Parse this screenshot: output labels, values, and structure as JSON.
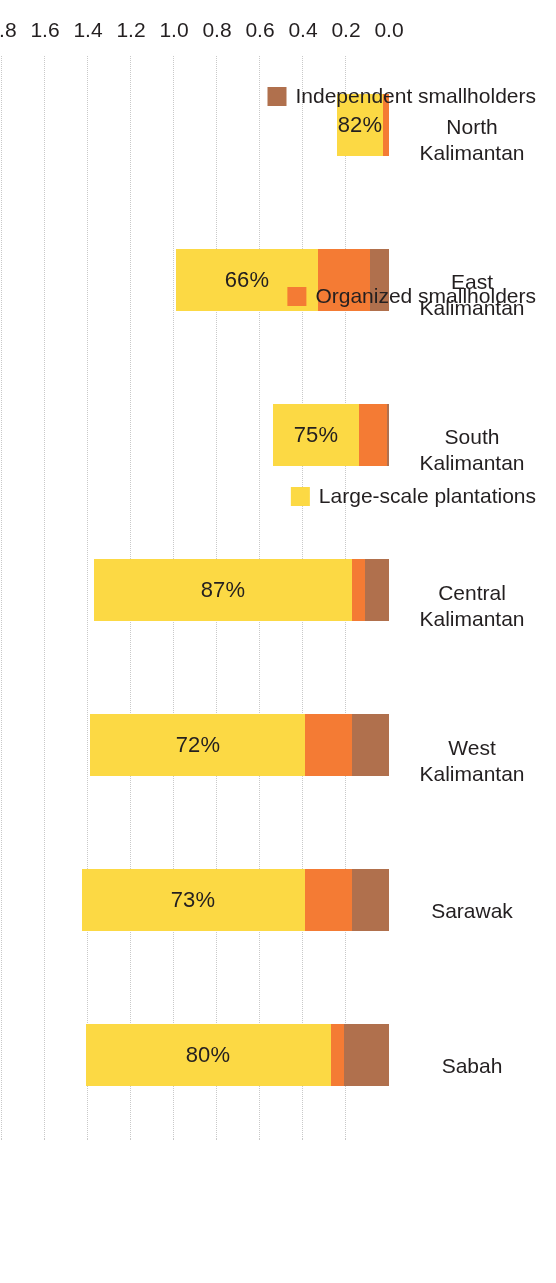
{
  "chart_data": {
    "type": "bar",
    "orientation": "horizontal-stacked",
    "title": "",
    "xlabel": "million ha",
    "ylabel": "",
    "rotation_degrees": 180,
    "grid": true,
    "legend_position": "bottom",
    "axis_range": [
      0.0,
      1.8
    ],
    "tick_labels": [
      "0.0",
      "0.2",
      "0.4",
      "0.6",
      "0.8",
      "1.0",
      "1.2",
      "1.4",
      "1.6",
      "1.8"
    ],
    "tick_values": [
      0.0,
      0.2,
      0.4,
      0.6,
      0.8,
      1.0,
      1.2,
      1.4,
      1.6,
      1.8
    ],
    "categories": [
      "Sabah",
      "Sarawak",
      "West Kalimantan",
      "Central Kalimantan",
      "South Kalimantan",
      "East Kalimantan",
      "North Kalimantan"
    ],
    "category_lines": [
      [
        "Sabah",
        ""
      ],
      [
        "Sarawak",
        ""
      ],
      [
        "West",
        "Kalimantan"
      ],
      [
        "Central",
        "Kalimantan"
      ],
      [
        "South",
        "Kalimantan"
      ],
      [
        "East",
        "Kalimantan"
      ],
      [
        "North",
        "Kalimantan"
      ]
    ],
    "series": [
      {
        "name": "Independent smallholders",
        "color": "#b0704d",
        "values": [
          0.21,
          0.17,
          0.17,
          0.11,
          0.01,
          0.09,
          0.0
        ]
      },
      {
        "name": "Organized smallholders",
        "color": "#f47b34",
        "values": [
          0.06,
          0.22,
          0.22,
          0.06,
          0.13,
          0.24,
          0.03
        ]
      },
      {
        "name": "Large-scale plantations",
        "color": "#fcd944",
        "values": [
          1.14,
          1.04,
          1.0,
          1.2,
          0.4,
          0.66,
          0.21
        ]
      }
    ],
    "totals": [
      1.41,
      1.43,
      1.39,
      1.37,
      0.54,
      0.99,
      0.24
    ],
    "data_labels": [
      "80%",
      "73%",
      "72%",
      "87%",
      "75%",
      "66%",
      "82%"
    ],
    "data_label_meaning": "share of large-scale plantations in total area"
  },
  "legend": {
    "items": [
      {
        "label": "Independent smallholders",
        "color": "#b0704d"
      },
      {
        "label": "Organized smallholders",
        "color": "#f47b34"
      },
      {
        "label": "Large-scale plantations",
        "color": "#fcd944"
      }
    ]
  },
  "axis": {
    "value_axis_title": "million ha"
  }
}
